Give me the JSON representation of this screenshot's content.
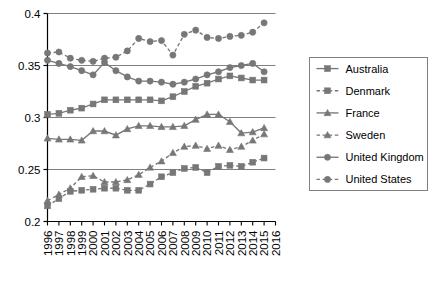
{
  "chart_data": {
    "type": "line",
    "title": "",
    "subtitle": "",
    "xlabel": "",
    "ylabel": "",
    "x": [
      1996,
      1997,
      1998,
      1999,
      2000,
      2001,
      2002,
      2003,
      2004,
      2005,
      2006,
      2007,
      2008,
      2009,
      2010,
      2011,
      2012,
      2013,
      2014,
      2015,
      2016
    ],
    "xtick_labels": [
      "1996",
      "1997",
      "1998",
      "1999",
      "2000",
      "2001",
      "2002",
      "2003",
      "2004",
      "2005",
      "2006",
      "2007",
      "2008",
      "2009",
      "2010",
      "2011",
      "2012",
      "2013",
      "2014",
      "2015",
      "2016"
    ],
    "ytick_labels": [
      "0.2",
      "0.25",
      "0.3",
      "0.35",
      "0.4"
    ],
    "yticks": [
      0.2,
      0.25,
      0.3,
      0.35,
      0.4
    ],
    "ylim": [
      0.2,
      0.4
    ],
    "xlim": [
      1996,
      2016
    ],
    "grid": "horizontal",
    "legend_position": "right-outside",
    "line_color": "#777777",
    "series": [
      {
        "name": "Australia",
        "marker": "square",
        "linestyle": "solid",
        "values": [
          0.303,
          0.304,
          0.307,
          0.309,
          0.313,
          0.317,
          0.317,
          0.317,
          0.317,
          0.317,
          0.316,
          0.32,
          0.325,
          0.33,
          0.333,
          0.337,
          0.34,
          0.338,
          0.336,
          0.336,
          null
        ]
      },
      {
        "name": "Denmark",
        "marker": "square",
        "linestyle": "dashed",
        "values": [
          0.215,
          0.222,
          0.229,
          0.23,
          0.231,
          0.232,
          0.232,
          0.23,
          0.23,
          0.236,
          0.243,
          0.247,
          0.251,
          0.252,
          0.247,
          0.253,
          0.254,
          0.253,
          0.257,
          0.261,
          null
        ]
      },
      {
        "name": "France",
        "marker": "triangle",
        "linestyle": "solid",
        "values": [
          0.28,
          0.279,
          0.279,
          0.278,
          0.287,
          0.287,
          0.283,
          0.289,
          0.292,
          0.292,
          0.291,
          0.291,
          0.292,
          0.298,
          0.303,
          0.303,
          0.296,
          0.285,
          0.286,
          0.29,
          null
        ]
      },
      {
        "name": "Sweden",
        "marker": "triangle",
        "linestyle": "dashed",
        "values": [
          0.22,
          0.226,
          0.232,
          0.243,
          0.244,
          0.238,
          0.238,
          0.24,
          0.245,
          0.252,
          0.258,
          0.266,
          0.272,
          0.273,
          0.27,
          0.273,
          0.269,
          0.272,
          0.278,
          0.284,
          null
        ]
      },
      {
        "name": "United Kingdom",
        "marker": "circle",
        "linestyle": "solid",
        "values": [
          0.355,
          0.352,
          0.349,
          0.345,
          0.341,
          0.353,
          0.345,
          0.339,
          0.335,
          0.335,
          0.334,
          0.332,
          0.334,
          0.337,
          0.341,
          0.344,
          0.348,
          0.35,
          0.352,
          0.344,
          null
        ]
      },
      {
        "name": "United States",
        "marker": "circle",
        "linestyle": "dashed",
        "values": [
          0.362,
          0.363,
          0.357,
          0.355,
          0.354,
          0.357,
          0.358,
          0.364,
          0.376,
          0.373,
          0.374,
          0.36,
          0.38,
          0.384,
          0.377,
          0.376,
          0.378,
          0.379,
          0.382,
          0.391,
          null
        ]
      }
    ]
  },
  "legend": {
    "items": [
      {
        "label": "Australia"
      },
      {
        "label": "Denmark"
      },
      {
        "label": "France"
      },
      {
        "label": "Sweden"
      },
      {
        "label": "United Kingdom"
      },
      {
        "label": "United States"
      }
    ]
  }
}
